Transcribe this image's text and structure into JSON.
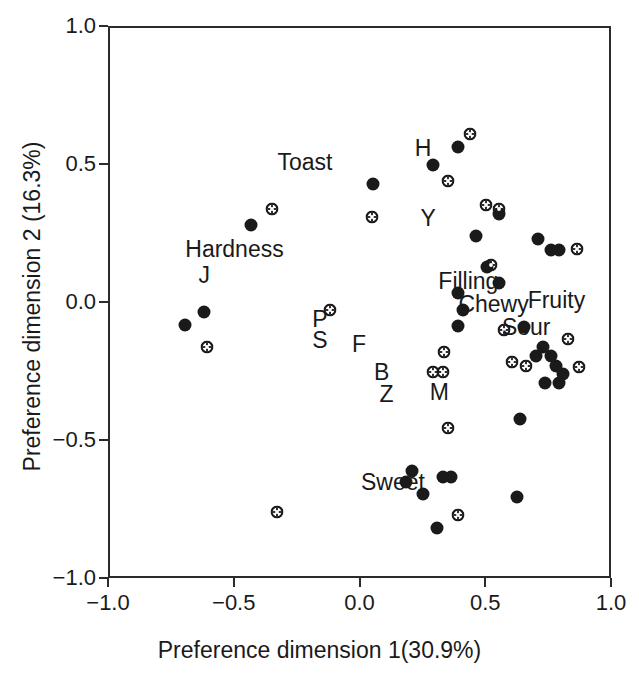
{
  "chart_data": {
    "type": "scatter",
    "title": "",
    "xlabel": "Preference dimension 1(30.9%)",
    "ylabel": "Preference dimension 2 (16.3%)",
    "xlim": [
      -1.0,
      1.0
    ],
    "ylim": [
      -1.0,
      1.0
    ],
    "xticks": [
      -1.0,
      -0.5,
      0.0,
      0.5,
      1.0
    ],
    "yticks": [
      -1.0,
      -0.5,
      0.0,
      0.5,
      1.0
    ],
    "xticklabels": [
      "-1.0",
      "-0.5",
      "0.0",
      "0.5",
      "1.0"
    ],
    "yticklabels": [
      "-1.0",
      "-0.5",
      "0.0",
      "0.5",
      "1.0"
    ],
    "grid": false,
    "legend": "none",
    "series": [
      {
        "name": "consumers-filled",
        "marker": "filled-circle",
        "color": "#1a1a1a",
        "points": [
          [
            -0.44,
            0.285
          ],
          [
            -0.7,
            -0.075
          ],
          [
            -0.625,
            -0.03
          ],
          [
            0.045,
            0.435
          ],
          [
            0.285,
            0.505
          ],
          [
            0.385,
            0.57
          ],
          [
            0.545,
            0.325
          ],
          [
            0.7,
            0.235
          ],
          [
            0.755,
            0.195
          ],
          [
            0.785,
            0.195
          ],
          [
            0.455,
            0.245
          ],
          [
            0.5,
            0.135
          ],
          [
            0.545,
            0.075
          ],
          [
            0.385,
            0.04
          ],
          [
            0.405,
            -0.02
          ],
          [
            0.385,
            -0.08
          ],
          [
            0.645,
            -0.085
          ],
          [
            0.72,
            -0.155
          ],
          [
            0.695,
            -0.19
          ],
          [
            0.755,
            -0.19
          ],
          [
            0.775,
            -0.225
          ],
          [
            0.8,
            -0.255
          ],
          [
            0.73,
            -0.285
          ],
          [
            0.785,
            -0.285
          ],
          [
            0.63,
            -0.415
          ],
          [
            0.2,
            -0.605
          ],
          [
            0.175,
            -0.645
          ],
          [
            0.245,
            -0.69
          ],
          [
            0.325,
            -0.625
          ],
          [
            0.355,
            -0.625
          ],
          [
            0.62,
            -0.7
          ],
          [
            0.3,
            -0.81
          ]
        ]
      },
      {
        "name": "products-open",
        "marker": "open-circle-cross",
        "color": "#1a1a1a",
        "points": [
          [
            -0.355,
            0.345
          ],
          [
            -0.615,
            -0.155
          ],
          [
            -0.125,
            -0.02
          ],
          [
            0.04,
            0.315
          ],
          [
            0.43,
            0.615
          ],
          [
            0.345,
            0.445
          ],
          [
            0.495,
            0.36
          ],
          [
            0.545,
            0.345
          ],
          [
            0.855,
            0.2
          ],
          [
            0.515,
            0.14
          ],
          [
            0.82,
            -0.125
          ],
          [
            0.565,
            -0.095
          ],
          [
            0.33,
            -0.175
          ],
          [
            0.285,
            -0.245
          ],
          [
            0.325,
            -0.245
          ],
          [
            0.6,
            -0.21
          ],
          [
            0.655,
            -0.225
          ],
          [
            0.865,
            -0.23
          ],
          [
            0.345,
            -0.45
          ],
          [
            -0.335,
            -0.755
          ],
          [
            0.385,
            -0.765
          ]
        ]
      }
    ],
    "annotations": [
      {
        "text": "Toast",
        "x": -0.225,
        "y": 0.515
      },
      {
        "text": "Hardness",
        "x": -0.505,
        "y": 0.2
      },
      {
        "text": "J",
        "x": -0.625,
        "y": 0.105
      },
      {
        "text": "H",
        "x": 0.245,
        "y": 0.565
      },
      {
        "text": "Y",
        "x": 0.265,
        "y": 0.31
      },
      {
        "text": "Filling",
        "x": 0.425,
        "y": 0.085
      },
      {
        "text": "Chewy",
        "x": 0.525,
        "y": 0.0
      },
      {
        "text": "Fruity",
        "x": 0.775,
        "y": 0.015
      },
      {
        "text": "Sour",
        "x": 0.655,
        "y": -0.085
      },
      {
        "text": "P",
        "x": -0.165,
        "y": -0.055
      },
      {
        "text": "S",
        "x": -0.165,
        "y": -0.13
      },
      {
        "text": "F",
        "x": -0.01,
        "y": -0.145
      },
      {
        "text": "B",
        "x": 0.08,
        "y": -0.245
      },
      {
        "text": "Z",
        "x": 0.1,
        "y": -0.325
      },
      {
        "text": "M",
        "x": 0.31,
        "y": -0.32
      },
      {
        "text": "Sweet",
        "x": 0.125,
        "y": -0.645
      }
    ]
  },
  "geometry": {
    "plot_left": 108,
    "plot_top": 26,
    "plot_width": 503,
    "plot_height": 552
  }
}
